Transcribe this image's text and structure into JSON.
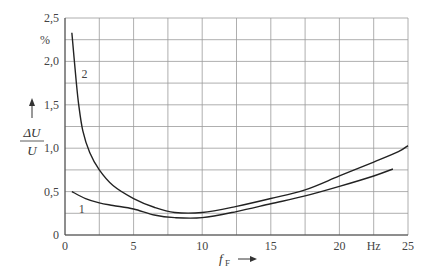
{
  "chart_data": {
    "type": "line",
    "title": "",
    "xlabel": "f_F",
    "xlabel_main": "f",
    "xlabel_sub": "F",
    "x_unit": "Hz",
    "ylabel_num": "ΔU",
    "ylabel_den": "U",
    "y_unit": "%",
    "xlim": [
      0,
      25
    ],
    "ylim": [
      0,
      2.5
    ],
    "grid": true,
    "x_ticks": [
      0,
      5,
      10,
      15,
      20,
      25
    ],
    "x_tick_labels": [
      "0",
      "5",
      "10",
      "15",
      "20",
      "Hz",
      "25"
    ],
    "y_ticks": [
      0,
      0.5,
      1.0,
      1.5,
      2.0,
      2.5
    ],
    "y_tick_labels": [
      "0",
      "0,5",
      "1,0",
      "1,5",
      "2,0",
      "2,5"
    ],
    "series": [
      {
        "name": "1",
        "x": [
          0.5,
          1.5,
          2.5,
          3.5,
          5,
          6.5,
          8,
          10,
          12.5,
          15,
          17.5,
          20,
          22.5,
          23.9
        ],
        "y": [
          0.5,
          0.42,
          0.37,
          0.34,
          0.3,
          0.23,
          0.2,
          0.2,
          0.27,
          0.36,
          0.45,
          0.56,
          0.68,
          0.76
        ]
      },
      {
        "name": "2",
        "x": [
          0.5,
          0.8,
          1.0,
          1.3,
          1.8,
          2.5,
          3.5,
          5,
          6.5,
          8,
          10,
          12.5,
          15,
          17.5,
          20,
          22.5,
          24.3,
          25
        ],
        "y": [
          2.33,
          1.8,
          1.5,
          1.2,
          0.95,
          0.75,
          0.57,
          0.42,
          0.32,
          0.26,
          0.26,
          0.33,
          0.42,
          0.52,
          0.68,
          0.84,
          0.96,
          1.03
        ]
      }
    ],
    "annotations": [
      {
        "text": "1",
        "x": 1.0,
        "y": 0.3
      },
      {
        "text": "2",
        "x": 1.2,
        "y": 1.85
      }
    ]
  }
}
